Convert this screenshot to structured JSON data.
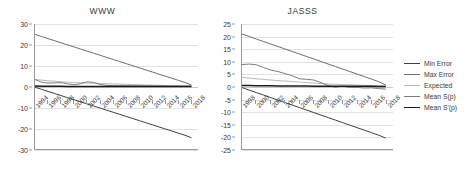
{
  "legend": {
    "position": "right",
    "items": [
      {
        "label": "Min Error",
        "color": "#404040"
      },
      {
        "label": "Max Error",
        "color": "#6e6e6e"
      },
      {
        "label": "Expected",
        "color": "#b9b9b9"
      },
      {
        "label": "Mean S(p)",
        "color": "#7d7d7d"
      },
      {
        "label": "Mean S'(p)",
        "color": "#1a1a1a"
      }
    ]
  },
  "chart_data": [
    {
      "type": "line",
      "title": "WWW",
      "xlabel": "",
      "ylabel": "",
      "grid": true,
      "legend_position": "right",
      "xlim": [
        1994,
        2019
      ],
      "ylim": [
        -30,
        30
      ],
      "yticks": [
        30,
        20,
        10,
        0,
        -10,
        -20,
        -30
      ],
      "x": [
        1994,
        1995,
        1996,
        1997,
        1998,
        1999,
        2000,
        2001,
        2002,
        2003,
        2004,
        2005,
        2006,
        2007,
        2008,
        2009,
        2010,
        2011,
        2012,
        2013,
        2014,
        2015,
        2016,
        2017,
        2018
      ],
      "xtick_labels": [
        "1994",
        "1996",
        "1998",
        "2000",
        "2002",
        "2004",
        "2006",
        "2008",
        "2010",
        "2012",
        "2014",
        "2016",
        "2018"
      ],
      "series": [
        {
          "name": "Max Error",
          "color": "#6e6e6e",
          "values": [
            25.0,
            24.0,
            23.0,
            22.0,
            21.0,
            20.0,
            19.0,
            18.0,
            17.0,
            16.0,
            15.0,
            14.0,
            13.0,
            12.0,
            11.0,
            10.0,
            9.0,
            8.0,
            7.0,
            6.0,
            5.0,
            4.0,
            3.0,
            2.0,
            0.8
          ]
        },
        {
          "name": "Min Error",
          "color": "#404040",
          "values": [
            -0.3,
            -1.3,
            -2.3,
            -3.3,
            -4.3,
            -5.3,
            -6.3,
            -7.3,
            -8.3,
            -9.3,
            -10.3,
            -11.3,
            -12.3,
            -13.3,
            -14.3,
            -15.3,
            -16.3,
            -17.3,
            -18.3,
            -19.3,
            -20.3,
            -21.3,
            -22.3,
            -23.3,
            -24.5
          ]
        },
        {
          "name": "Expected",
          "color": "#b9b9b9",
          "values": [
            3.4,
            3.1,
            2.8,
            2.6,
            2.3,
            2.1,
            1.9,
            1.8,
            1.7,
            1.6,
            1.5,
            1.4,
            1.3,
            1.2,
            1.1,
            1.0,
            0.9,
            0.8,
            0.7,
            0.6,
            0.5,
            0.4,
            0.35,
            0.3,
            0.25
          ]
        },
        {
          "name": "Mean S(p)",
          "color": "#7d7d7d",
          "values": [
            3.4,
            2.1,
            1.7,
            1.8,
            1.9,
            1.3,
            0.9,
            1.4,
            2.3,
            2.0,
            1.0,
            0.6,
            0.5,
            0.5,
            0.45,
            0.4,
            0.4,
            0.35,
            0.3,
            0.3,
            0.25,
            0.25,
            0.2,
            0.2,
            0.2
          ]
        },
        {
          "name": "Mean S'(p)",
          "color": "#1a1a1a",
          "values": [
            0.3,
            0.2,
            0.2,
            0.15,
            0.15,
            0.1,
            0.1,
            0.1,
            0.1,
            0.1,
            0.1,
            0.05,
            0.05,
            0.05,
            0.05,
            0.05,
            0.05,
            0.05,
            0.05,
            0.05,
            0.05,
            0.05,
            0.05,
            0.05,
            0.05
          ]
        }
      ]
    },
    {
      "type": "line",
      "title": "JASSS",
      "xlabel": "",
      "ylabel": "",
      "grid": true,
      "legend_position": "right",
      "xlim": [
        1998,
        2019
      ],
      "ylim": [
        -25,
        25
      ],
      "yticks": [
        25,
        20,
        15,
        10,
        5,
        0,
        -5,
        -10,
        -15,
        -20,
        -25
      ],
      "x": [
        1998,
        1999,
        2000,
        2001,
        2002,
        2003,
        2004,
        2005,
        2006,
        2007,
        2008,
        2009,
        2010,
        2011,
        2012,
        2013,
        2014,
        2015,
        2016,
        2017,
        2018
      ],
      "xtick_labels": [
        "1998",
        "2000",
        "2002",
        "2004",
        "2006",
        "2008",
        "2010",
        "2012",
        "2014",
        "2016",
        "2018"
      ],
      "series": [
        {
          "name": "Max Error",
          "color": "#6e6e6e",
          "values": [
            21.0,
            20.0,
            19.0,
            18.0,
            17.0,
            16.0,
            15.0,
            14.0,
            13.0,
            12.0,
            11.0,
            10.0,
            9.0,
            8.0,
            7.0,
            6.0,
            5.0,
            4.0,
            3.0,
            2.0,
            0.6
          ]
        },
        {
          "name": "Min Error",
          "color": "#404040",
          "values": [
            -0.4,
            -1.4,
            -2.4,
            -3.4,
            -4.4,
            -5.4,
            -6.4,
            -7.4,
            -8.4,
            -9.4,
            -10.4,
            -11.4,
            -12.4,
            -13.4,
            -14.4,
            -15.4,
            -16.4,
            -17.4,
            -18.4,
            -19.4,
            -20.6
          ]
        },
        {
          "name": "Expected",
          "color": "#b9b9b9",
          "values": [
            3.7,
            3.4,
            3.1,
            2.9,
            2.6,
            2.4,
            2.2,
            2.0,
            1.8,
            1.6,
            1.4,
            1.2,
            1.0,
            0.9,
            0.8,
            0.7,
            0.6,
            0.5,
            0.4,
            0.3,
            0.2
          ]
        },
        {
          "name": "Mean S(p)",
          "color": "#7d7d7d",
          "values": [
            8.8,
            9.0,
            8.7,
            7.6,
            6.6,
            6.0,
            5.2,
            4.3,
            3.1,
            2.9,
            2.6,
            1.6,
            0.4,
            -0.3,
            0.2,
            -0.4,
            -0.3,
            -0.6,
            -0.5,
            -0.8,
            -1.0
          ]
        },
        {
          "name": "Mean S'(p)",
          "color": "#1a1a1a",
          "values": [
            0.4,
            0.4,
            0.35,
            0.3,
            0.3,
            0.25,
            0.25,
            0.2,
            0.2,
            0.2,
            0.15,
            0.15,
            0.15,
            0.1,
            0.1,
            0.1,
            0.1,
            0.1,
            0.1,
            0.05,
            0.05
          ]
        }
      ]
    }
  ]
}
